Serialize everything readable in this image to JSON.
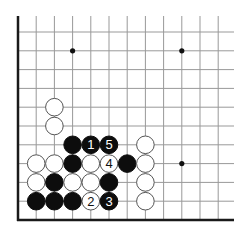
{
  "diagram": {
    "type": "go-board-corner",
    "grid": {
      "origin_x": 18,
      "origin_y": 32,
      "dx": 18.2,
      "dy": 18.8,
      "cols": 12,
      "rows": 11,
      "line_color": "#999999",
      "edge_color": "#1a1a1a"
    },
    "star_points": [
      [
        3,
        1
      ],
      [
        9,
        1
      ],
      [
        9,
        7
      ]
    ],
    "stones": [
      {
        "col": 2,
        "row": 4,
        "color": "white",
        "label": ""
      },
      {
        "col": 2,
        "row": 5,
        "color": "white",
        "label": ""
      },
      {
        "col": 3,
        "row": 6,
        "color": "black",
        "label": ""
      },
      {
        "col": 4,
        "row": 6,
        "color": "black",
        "label": "1"
      },
      {
        "col": 5,
        "row": 6,
        "color": "black",
        "label": "5"
      },
      {
        "col": 7,
        "row": 6,
        "color": "white",
        "label": ""
      },
      {
        "col": 1,
        "row": 7,
        "color": "white",
        "label": ""
      },
      {
        "col": 2,
        "row": 7,
        "color": "white",
        "label": ""
      },
      {
        "col": 3,
        "row": 7,
        "color": "black",
        "label": ""
      },
      {
        "col": 4,
        "row": 7,
        "color": "white",
        "label": ""
      },
      {
        "col": 5,
        "row": 7,
        "color": "white",
        "label": "4"
      },
      {
        "col": 6,
        "row": 7,
        "color": "black",
        "label": ""
      },
      {
        "col": 7,
        "row": 7,
        "color": "white",
        "label": ""
      },
      {
        "col": 1,
        "row": 8,
        "color": "white",
        "label": ""
      },
      {
        "col": 2,
        "row": 8,
        "color": "black",
        "label": ""
      },
      {
        "col": 3,
        "row": 8,
        "color": "white",
        "label": ""
      },
      {
        "col": 4,
        "row": 8,
        "color": "white",
        "label": ""
      },
      {
        "col": 5,
        "row": 8,
        "color": "black",
        "label": ""
      },
      {
        "col": 7,
        "row": 8,
        "color": "white",
        "label": ""
      },
      {
        "col": 1,
        "row": 9,
        "color": "black",
        "label": ""
      },
      {
        "col": 2,
        "row": 9,
        "color": "black",
        "label": ""
      },
      {
        "col": 3,
        "row": 9,
        "color": "black",
        "label": ""
      },
      {
        "col": 4,
        "row": 9,
        "color": "white",
        "label": "2"
      },
      {
        "col": 5,
        "row": 9,
        "color": "black",
        "label": "3"
      },
      {
        "col": 7,
        "row": 9,
        "color": "white",
        "label": ""
      }
    ]
  }
}
